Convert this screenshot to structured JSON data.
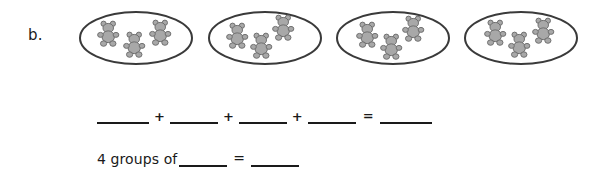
{
  "worksheet": {
    "problem_label": "b.",
    "background_color": "#ffffff",
    "text_color": "#1a1a1a"
  },
  "groups": {
    "count": 4,
    "items_per_group": 3,
    "item_icon": "teddy-bear-icon",
    "container_shape": "ellipse",
    "ellipse_stroke_color": "#3a3a3a",
    "bear_fill_color": "#a8a8a8",
    "bear_stroke_color": "#6e6e6e",
    "list": [
      {
        "index": 1,
        "bear_count": 3
      },
      {
        "index": 2,
        "bear_count": 3
      },
      {
        "index": 3,
        "bear_count": 3
      },
      {
        "index": 4,
        "bear_count": 3
      }
    ]
  },
  "addition_line": {
    "blank_1": "",
    "plus_1": "+",
    "blank_2": "",
    "plus_2": "+",
    "blank_3": "",
    "plus_3": "+",
    "blank_4": "",
    "equals": "=",
    "blank_answer": ""
  },
  "sentence_line": {
    "prefix": "4 groups of",
    "blank_group_size": "",
    "equals": "=",
    "blank_total": ""
  }
}
